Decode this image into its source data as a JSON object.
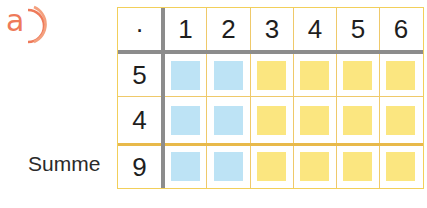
{
  "exercise_label": "a",
  "colors": {
    "accent": "#ee7a5a",
    "blue": "#bde3f5",
    "yellow": "#fbe680",
    "grid": "#efc96a",
    "divider": "#8c8c8c"
  },
  "table": {
    "operator": "·",
    "column_headers": [
      "1",
      "2",
      "3",
      "4",
      "5",
      "6"
    ],
    "rows": [
      {
        "label": "",
        "value": "5",
        "cells": [
          "blue",
          "blue",
          "yellow",
          "yellow",
          "yellow",
          "yellow"
        ]
      },
      {
        "label": "",
        "value": "4",
        "cells": [
          "blue",
          "blue",
          "yellow",
          "yellow",
          "yellow",
          "yellow"
        ]
      },
      {
        "label": "Summe",
        "value": "9",
        "cells": [
          "blue",
          "blue",
          "yellow",
          "yellow",
          "yellow",
          "yellow"
        ]
      }
    ]
  }
}
